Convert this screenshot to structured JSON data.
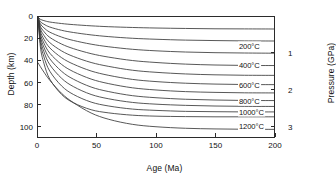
{
  "chart_data": {
    "type": "line",
    "title": "",
    "subtitle": "",
    "xlabel": "Age (Ma)",
    "ylabel": "Depth (km)",
    "y2label": "Pressure (GPa)",
    "xlim": [
      0,
      200
    ],
    "ylim": [
      0,
      110
    ],
    "y2lim": [
      0,
      3.3
    ],
    "y_inverted": true,
    "grid": false,
    "legend": "none",
    "x_ticks": [
      0,
      50,
      100,
      150,
      200
    ],
    "x_tick_labels": [
      "0",
      "50",
      "100",
      "150",
      "200"
    ],
    "y_ticks": [
      0,
      20,
      40,
      60,
      80,
      100
    ],
    "y_tick_labels": [
      "0",
      "20",
      "40",
      "60",
      "80",
      "100"
    ],
    "y2_ticks": [
      1,
      2,
      3
    ],
    "y2_tick_labels": [
      "1",
      "2",
      "3"
    ],
    "line_color": "#3a3a3a",
    "frame_color": "#2b2b2b",
    "annotations": [
      {
        "text": "200°C",
        "x": 200,
        "y": 27
      },
      {
        "text": "400°C",
        "x": 200,
        "y": 44
      },
      {
        "text": "600°C",
        "x": 200,
        "y": 62
      },
      {
        "text": "800°C",
        "x": 200,
        "y": 77
      },
      {
        "text": "1000°C",
        "x": 200,
        "y": 87
      },
      {
        "text": "1200°C",
        "x": 200,
        "y": 99
      }
    ],
    "series": [
      {
        "name": "100°C",
        "labeled": false,
        "y_end": 11.0,
        "points": [
          [
            0,
            0
          ],
          [
            2,
            2.1
          ],
          [
            5,
            3.3
          ],
          [
            10,
            4.6
          ],
          [
            20,
            6.0
          ],
          [
            30,
            7.0
          ],
          [
            45,
            8.1
          ],
          [
            60,
            8.9
          ],
          [
            80,
            9.6
          ],
          [
            100,
            10.1
          ],
          [
            125,
            10.5
          ],
          [
            150,
            10.8
          ],
          [
            175,
            10.9
          ],
          [
            200,
            11.0
          ]
        ]
      },
      {
        "name": "200°C",
        "labeled": true,
        "y_end": 22.0,
        "points": [
          [
            0,
            0
          ],
          [
            2,
            4.2
          ],
          [
            5,
            6.6
          ],
          [
            10,
            9.2
          ],
          [
            20,
            12.2
          ],
          [
            30,
            14.2
          ],
          [
            45,
            16.4
          ],
          [
            60,
            18.0
          ],
          [
            80,
            19.5
          ],
          [
            100,
            20.4
          ],
          [
            125,
            21.2
          ],
          [
            150,
            21.6
          ],
          [
            175,
            21.9
          ],
          [
            200,
            22.0
          ]
        ]
      },
      {
        "name": "300°C",
        "labeled": false,
        "y_end": 33.2,
        "points": [
          [
            0,
            0
          ],
          [
            2,
            6.3
          ],
          [
            5,
            9.9
          ],
          [
            10,
            13.9
          ],
          [
            20,
            18.4
          ],
          [
            30,
            21.5
          ],
          [
            45,
            24.9
          ],
          [
            60,
            27.3
          ],
          [
            80,
            29.6
          ],
          [
            100,
            31.0
          ],
          [
            125,
            32.1
          ],
          [
            150,
            32.7
          ],
          [
            175,
            33.0
          ],
          [
            200,
            33.2
          ]
        ]
      },
      {
        "name": "400°C",
        "labeled": true,
        "y_end": 44.5,
        "points": [
          [
            0,
            0
          ],
          [
            2,
            8.4
          ],
          [
            5,
            13.3
          ],
          [
            10,
            18.7
          ],
          [
            20,
            24.8
          ],
          [
            30,
            29.0
          ],
          [
            45,
            33.6
          ],
          [
            60,
            36.8
          ],
          [
            80,
            39.9
          ],
          [
            100,
            41.7
          ],
          [
            125,
            43.2
          ],
          [
            150,
            44.0
          ],
          [
            175,
            44.4
          ],
          [
            200,
            44.5
          ]
        ]
      },
      {
        "name": "500°C",
        "labeled": false,
        "y_end": 53.5,
        "points": [
          [
            0,
            0
          ],
          [
            2,
            10.6
          ],
          [
            5,
            16.8
          ],
          [
            10,
            23.5
          ],
          [
            20,
            31.1
          ],
          [
            30,
            36.2
          ],
          [
            45,
            41.7
          ],
          [
            60,
            45.3
          ],
          [
            80,
            48.8
          ],
          [
            100,
            50.7
          ],
          [
            125,
            52.2
          ],
          [
            150,
            53.0
          ],
          [
            175,
            53.4
          ],
          [
            200,
            53.5
          ]
        ]
      },
      {
        "name": "600°C",
        "labeled": true,
        "y_end": 62.0,
        "points": [
          [
            0,
            0
          ],
          [
            2,
            12.8
          ],
          [
            5,
            20.3
          ],
          [
            10,
            28.3
          ],
          [
            20,
            37.3
          ],
          [
            30,
            43.2
          ],
          [
            45,
            49.5
          ],
          [
            60,
            53.5
          ],
          [
            80,
            57.2
          ],
          [
            100,
            59.2
          ],
          [
            125,
            60.7
          ],
          [
            150,
            61.5
          ],
          [
            175,
            61.9
          ],
          [
            200,
            62.0
          ]
        ]
      },
      {
        "name": "700°C",
        "labeled": false,
        "y_end": 69.6,
        "points": [
          [
            0,
            0
          ],
          [
            2,
            15.1
          ],
          [
            5,
            23.9
          ],
          [
            10,
            33.2
          ],
          [
            20,
            43.5
          ],
          [
            30,
            50.1
          ],
          [
            45,
            56.9
          ],
          [
            60,
            61.1
          ],
          [
            80,
            64.9
          ],
          [
            100,
            66.9
          ],
          [
            125,
            68.4
          ],
          [
            150,
            69.1
          ],
          [
            175,
            69.5
          ],
          [
            200,
            69.6
          ]
        ]
      },
      {
        "name": "800°C",
        "labeled": true,
        "y_end": 76.6,
        "points": [
          [
            0,
            0
          ],
          [
            2,
            17.5
          ],
          [
            5,
            27.7
          ],
          [
            10,
            38.3
          ],
          [
            20,
            49.8
          ],
          [
            30,
            57.0
          ],
          [
            45,
            64.2
          ],
          [
            60,
            68.4
          ],
          [
            80,
            72.1
          ],
          [
            100,
            74.0
          ],
          [
            125,
            75.4
          ],
          [
            150,
            76.1
          ],
          [
            175,
            76.5
          ],
          [
            200,
            76.6
          ]
        ]
      },
      {
        "name": "900°C",
        "labeled": false,
        "y_end": 82.0,
        "points": [
          [
            0,
            0
          ],
          [
            2,
            20.2
          ],
          [
            5,
            31.8
          ],
          [
            10,
            43.7
          ],
          [
            20,
            56.2
          ],
          [
            30,
            63.8
          ],
          [
            45,
            71.0
          ],
          [
            60,
            75.0
          ],
          [
            80,
            78.3
          ],
          [
            100,
            79.9
          ],
          [
            125,
            81.0
          ],
          [
            150,
            81.6
          ],
          [
            175,
            81.9
          ],
          [
            200,
            82.0
          ]
        ]
      },
      {
        "name": "1000°C",
        "labeled": true,
        "y_end": 87.0,
        "points": [
          [
            0,
            0
          ],
          [
            2,
            23.3
          ],
          [
            5,
            36.5
          ],
          [
            10,
            49.7
          ],
          [
            20,
            63.2
          ],
          [
            30,
            71.0
          ],
          [
            45,
            78.0
          ],
          [
            60,
            81.6
          ],
          [
            80,
            84.4
          ],
          [
            100,
            85.6
          ],
          [
            125,
            86.5
          ],
          [
            150,
            86.8
          ],
          [
            175,
            87.0
          ],
          [
            200,
            87.0
          ]
        ]
      },
      {
        "name": "1100°C",
        "labeled": false,
        "y_end": 91.5,
        "points": [
          [
            0,
            0
          ],
          [
            2,
            27.4
          ],
          [
            5,
            42.4
          ],
          [
            10,
            57.0
          ],
          [
            20,
            71.0
          ],
          [
            30,
            78.6
          ],
          [
            45,
            85.0
          ],
          [
            60,
            87.9
          ],
          [
            80,
            90.0
          ],
          [
            100,
            90.9
          ],
          [
            125,
            91.3
          ],
          [
            150,
            91.5
          ],
          [
            175,
            91.5
          ],
          [
            200,
            91.5
          ]
        ]
      },
      {
        "name": "1200°C",
        "labeled": true,
        "y_end": 103.0,
        "points": [
          [
            0,
            42.0
          ],
          [
            2,
            45.5
          ],
          [
            5,
            50.5
          ],
          [
            10,
            58.0
          ],
          [
            20,
            70.0
          ],
          [
            30,
            78.5
          ],
          [
            45,
            88.0
          ],
          [
            60,
            93.8
          ],
          [
            80,
            98.4
          ],
          [
            100,
            100.6
          ],
          [
            125,
            102.0
          ],
          [
            150,
            102.6
          ],
          [
            175,
            102.9
          ],
          [
            200,
            103.0
          ]
        ]
      }
    ]
  }
}
